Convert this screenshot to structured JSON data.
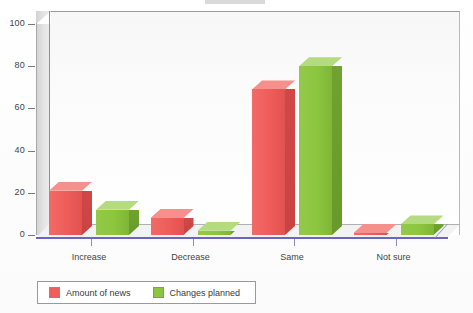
{
  "chart_data": {
    "type": "bar",
    "title": "",
    "subtitle": "",
    "xlabel": "",
    "ylabel": "",
    "categories": [
      "Increase",
      "Decrease",
      "Same",
      "Not sure"
    ],
    "series": [
      {
        "name": "Amount of news",
        "color": "#EF5C5A",
        "values": [
          21,
          8,
          69,
          1
        ]
      },
      {
        "name": "Changes planned",
        "color": "#8CC63E",
        "values": [
          12,
          2,
          80,
          5
        ]
      }
    ],
    "ylim": [
      0,
      100
    ],
    "ytick_values": [
      0,
      20,
      40,
      60,
      80,
      100
    ],
    "ytick_labels": [
      "0",
      "20",
      "40",
      "60",
      "80",
      "100"
    ],
    "grid": false,
    "legend_position": "bottom",
    "style": "3d-grouped-bars",
    "accent_colors": {
      "series_red": "#EF5C5A",
      "series_green": "#8CC63E",
      "floor_edge": "#6A63C8",
      "wall": "#E4E4E4",
      "axis_text": "#444444"
    }
  },
  "legend": {
    "entries": [
      {
        "label": "Amount of news",
        "swatch_color": "#EF5C5A",
        "icon": "legend-swatch-red"
      },
      {
        "label": "Changes planned",
        "swatch_color": "#8CC63E",
        "icon": "legend-swatch-green"
      }
    ]
  },
  "axes": {
    "y_labels": [
      "100",
      "80",
      "60",
      "40",
      "20",
      "0"
    ],
    "x_labels": [
      "Increase",
      "Decrease",
      "Same",
      "Not sure"
    ]
  }
}
